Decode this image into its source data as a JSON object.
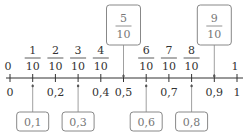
{
  "diagram": {
    "type": "number-line",
    "range": [
      0,
      1
    ],
    "step": 0.1,
    "top_labels": [
      {
        "value": 0,
        "text": "0"
      },
      {
        "value": 0.1,
        "num": "1",
        "den": "10"
      },
      {
        "value": 0.2,
        "num": "2",
        "den": "10"
      },
      {
        "value": 0.3,
        "num": "3",
        "den": "10"
      },
      {
        "value": 0.4,
        "num": "4",
        "den": "10"
      },
      {
        "value": 0.6,
        "num": "6",
        "den": "10"
      },
      {
        "value": 0.7,
        "num": "7",
        "den": "10"
      },
      {
        "value": 0.8,
        "num": "8",
        "den": "10"
      },
      {
        "value": 1,
        "text": "1"
      }
    ],
    "bottom_labels": [
      {
        "value": 0,
        "text": "0"
      },
      {
        "value": 0.2,
        "text": "0,2"
      },
      {
        "value": 0.4,
        "text": "0,4"
      },
      {
        "value": 0.5,
        "text": "0,5"
      },
      {
        "value": 0.7,
        "text": "0,7"
      },
      {
        "value": 0.9,
        "text": "0,9"
      },
      {
        "value": 1,
        "text": "1"
      }
    ],
    "answer_boxes_top": [
      {
        "value": 0.5,
        "num": "5",
        "den": "10"
      },
      {
        "value": 0.9,
        "num": "9",
        "den": "10"
      }
    ],
    "answer_boxes_bottom": [
      {
        "value": 0.1,
        "text": "0,1"
      },
      {
        "value": 0.3,
        "text": "0,3"
      },
      {
        "value": 0.6,
        "text": "0,6"
      },
      {
        "value": 0.8,
        "text": "0,8"
      }
    ],
    "colors": {
      "line": "#333333",
      "box_border": "#888888",
      "box_text": "#777777",
      "label": "#333333"
    }
  }
}
